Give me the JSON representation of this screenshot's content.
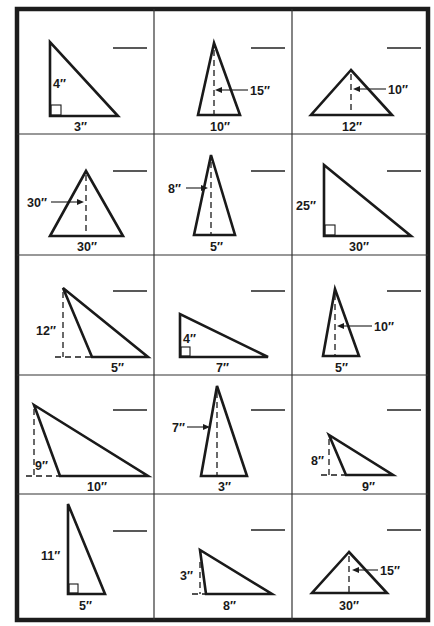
{
  "worksheet": {
    "title": "Triangle area problems",
    "unit_mark": "″",
    "problems": [
      {
        "id": 1,
        "height": "4″",
        "base": "3″",
        "type": "right",
        "answer": ""
      },
      {
        "id": 2,
        "height": "15″",
        "base": "10″",
        "type": "acute-arrow",
        "answer": ""
      },
      {
        "id": 3,
        "height": "10″",
        "base": "12″",
        "type": "acute-arrow",
        "answer": ""
      },
      {
        "id": 4,
        "height": "30″",
        "base": "30″",
        "type": "acute-arrow",
        "answer": ""
      },
      {
        "id": 5,
        "height": "8″",
        "base": "5″",
        "type": "acute-arrow",
        "answer": ""
      },
      {
        "id": 6,
        "height": "25″",
        "base": "30″",
        "type": "right",
        "answer": ""
      },
      {
        "id": 7,
        "height": "12″",
        "base": "5″",
        "type": "obtuse",
        "answer": ""
      },
      {
        "id": 8,
        "height": "4″",
        "base": "7″",
        "type": "right",
        "answer": ""
      },
      {
        "id": 9,
        "height": "10″",
        "base": "5″",
        "type": "acute-arrow",
        "answer": ""
      },
      {
        "id": 10,
        "height": "9″",
        "base": "10″",
        "type": "obtuse",
        "answer": ""
      },
      {
        "id": 11,
        "height": "7″",
        "base": "3″",
        "type": "acute-arrow",
        "answer": ""
      },
      {
        "id": 12,
        "height": "8″",
        "base": "9″",
        "type": "obtuse",
        "answer": ""
      },
      {
        "id": 13,
        "height": "11″",
        "base": "5″",
        "type": "right",
        "answer": ""
      },
      {
        "id": 14,
        "height": "3″",
        "base": "8″",
        "type": "obtuse",
        "answer": ""
      },
      {
        "id": 15,
        "height": "15″",
        "base": "30″",
        "type": "acute-arrow",
        "answer": ""
      }
    ]
  },
  "colors": {
    "ink": "#1a1a1a",
    "paper": "#ffffff"
  }
}
